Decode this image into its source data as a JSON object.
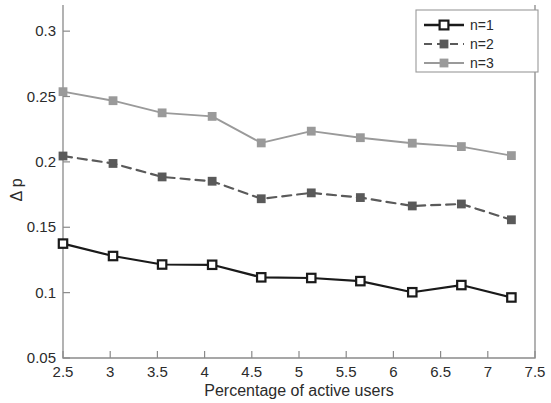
{
  "chart_data": {
    "type": "line",
    "title": "",
    "xlabel": "Percentage of active users",
    "ylabel": "Δ p",
    "xlim": [
      2.5,
      7.5
    ],
    "ylim": [
      0.05,
      0.32
    ],
    "grid": false,
    "legend_position": "top-right",
    "x_ticks": [
      "2.5",
      "3",
      "3.5",
      "4",
      "4.5",
      "5",
      "5.5",
      "6",
      "6.5",
      "7",
      "7.5"
    ],
    "x_tick_values": [
      2.5,
      3,
      3.5,
      4,
      4.5,
      5,
      5.5,
      6,
      6.5,
      7,
      7.5
    ],
    "y_ticks": [
      "0.05",
      "0.1",
      "0.15",
      "0.2",
      "0.25",
      "0.3"
    ],
    "y_tick_values": [
      0.05,
      0.1,
      0.15,
      0.2,
      0.25,
      0.3
    ],
    "x": [
      2.5,
      3.03,
      3.55,
      4.08,
      4.6,
      5.13,
      5.65,
      6.2,
      6.72,
      7.25
    ],
    "series": [
      {
        "name": "n=1",
        "color": "#1a1a1a",
        "linestyle": "solid",
        "marker": "square",
        "values": [
          0.1375,
          0.128,
          0.1215,
          0.1213,
          0.1117,
          0.1112,
          0.1088,
          0.1003,
          0.1058,
          0.0963
        ]
      },
      {
        "name": "n=2",
        "color": "#5a5a5a",
        "linestyle": "dashed",
        "marker": "square",
        "values": [
          0.2045,
          0.1988,
          0.1885,
          0.1852,
          0.1718,
          0.1763,
          0.1727,
          0.1663,
          0.1678,
          0.1557
        ]
      },
      {
        "name": "n=3",
        "color": "#9a9a9a",
        "linestyle": "solid",
        "marker": "square",
        "values": [
          0.2537,
          0.2468,
          0.2375,
          0.2348,
          0.2145,
          0.2235,
          0.2185,
          0.2143,
          0.2117,
          0.2048
        ]
      }
    ]
  },
  "legend": {
    "entries": [
      {
        "label": "n=1"
      },
      {
        "label": "n=2"
      },
      {
        "label": "n=3"
      }
    ]
  },
  "axes": {
    "x_title": "Percentage of active users",
    "y_title": "Δ p"
  }
}
